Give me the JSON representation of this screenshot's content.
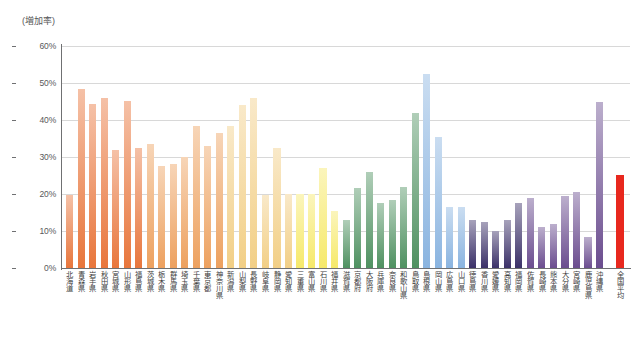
{
  "axis": {
    "unit_label": "(増加率)",
    "y_ticks": [
      "0%",
      "10%",
      "20%",
      "30%",
      "40%",
      "50%",
      "60%"
    ]
  },
  "chart_data": {
    "type": "bar",
    "title": "",
    "xlabel": "",
    "ylabel": "(増加率)",
    "ylim": [
      0,
      60
    ],
    "ytick_values": [
      0,
      10,
      20,
      30,
      40,
      50,
      60
    ],
    "ytick_labels": [
      "0%",
      "10%",
      "20%",
      "30%",
      "40%",
      "50%",
      "60%"
    ],
    "grid": true,
    "legend": "none",
    "value_unit": "percent",
    "categories": [
      "北海道",
      "青森県",
      "岩手県",
      "秋田県",
      "宮城県",
      "山形県",
      "福島県",
      "茨城県",
      "栃木県",
      "群馬県",
      "埼玉県",
      "千葉県",
      "東京都",
      "神奈川県",
      "新潟県",
      "山梨県",
      "長野県",
      "岐阜県",
      "静岡県",
      "愛知県",
      "三重県",
      "富山県",
      "石川県",
      "福井県",
      "滋賀県",
      "京都府",
      "大阪府",
      "兵庫県",
      "奈良県",
      "和歌山県",
      "鳥取県",
      "島根県",
      "岡山県",
      "広島県",
      "山口県",
      "徳島県",
      "香川県",
      "愛媛県",
      "高知県",
      "福岡県",
      "佐賀県",
      "長崎県",
      "熊本県",
      "大分県",
      "宮崎県",
      "鹿児島県",
      "沖縄県",
      "全国平均"
    ],
    "values": [
      19.8,
      48.5,
      44.2,
      46.0,
      32.0,
      45.2,
      32.5,
      33.5,
      27.5,
      28.2,
      30.0,
      38.5,
      33.0,
      36.5,
      38.5,
      44.0,
      46.0,
      19.8,
      32.5,
      20.0,
      20.0,
      20.0,
      27.0,
      15.5,
      13.0,
      21.5,
      26.0,
      17.5,
      18.5,
      22.0,
      42.0,
      52.5,
      35.5,
      16.5,
      16.5,
      13.0,
      12.5,
      10.0,
      13.0,
      17.5,
      19.0,
      11.0,
      12.0,
      19.5,
      20.5,
      8.5,
      45.0,
      25.2
    ],
    "bar_colors": [
      "#e8763c",
      "#e8763c",
      "#e8763c",
      "#e8763c",
      "#e8763c",
      "#e8763c",
      "#e8763c",
      "#eda15f",
      "#eda15f",
      "#eda15f",
      "#eda15f",
      "#eda15f",
      "#eda15f",
      "#eda15f",
      "#f2cf86",
      "#f2cf86",
      "#f2cf86",
      "#f2cf86",
      "#f2cf86",
      "#f2cf86",
      "#f6e96a",
      "#f6e96a",
      "#f6e96a",
      "#f6e96a",
      "#4f9161",
      "#4f9161",
      "#4f9161",
      "#4f9161",
      "#4f9161",
      "#4f9161",
      "#4f9161",
      "#8ab4e0",
      "#8ab4e0",
      "#8ab4e0",
      "#8ab4e0",
      "#3b3168",
      "#3b3168",
      "#3b3168",
      "#3b3168",
      "#3b3168",
      "#6b4d8f",
      "#6b4d8f",
      "#6b4d8f",
      "#6b4d8f",
      "#6b4d8f",
      "#6b4d8f",
      "#6b4d8f",
      "#e8281e"
    ],
    "highlight_category": "全国平均",
    "highlight_color": "#e8281e",
    "max_category": "島根県",
    "min_category": "鹿児島県"
  }
}
